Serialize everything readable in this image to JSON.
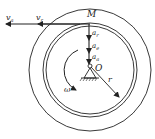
{
  "diagram": {
    "labels": {
      "point_M": "M",
      "point_O": "O",
      "radius": "r",
      "omega": "ω",
      "v_absolute": "v",
      "v_absolute_sub": "a",
      "v_relative": "v",
      "v_relative_sub": "r",
      "a_relative": "a",
      "a_relative_sub": "r",
      "a_transport": "a",
      "a_transport_sub": "e",
      "a_absolute": "a",
      "a_absolute_sub": "a"
    },
    "colors": {
      "stroke": "#222222",
      "background": "#ffffff"
    }
  }
}
